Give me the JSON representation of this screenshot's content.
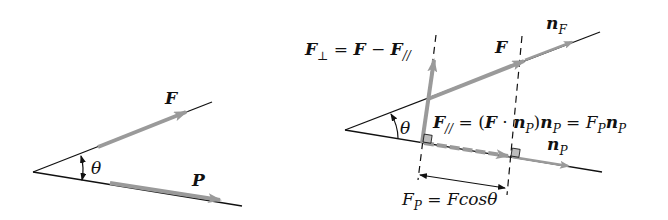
{
  "colors": {
    "line": "#111111",
    "vector": "#9a9a9a",
    "right_angle_fill": "#bdbdbd",
    "background": "#ffffff"
  },
  "left_diagram": {
    "vector_f_label": "F",
    "vector_p_label": "P",
    "angle_label": "θ"
  },
  "right_diagram": {
    "perp_formula": {
      "lhs": "F",
      "lhs_sub": "⊥",
      "eq": " = ",
      "f": "F",
      "minus": " − ",
      "f2": "F",
      "f2_sub": "//"
    },
    "vector_f_label": "F",
    "unit_f_label": "n",
    "unit_f_sub": "F",
    "angle_label": "θ",
    "parallel_formula": {
      "lhs": "F",
      "lhs_sub": "//",
      "eq1": " = (",
      "f": "F",
      "dot": " · ",
      "n1": "n",
      "n1_sub": "P",
      "close": ")",
      "n2": "n",
      "n2_sub": "P",
      "eq2": " = ",
      "fp": "F",
      "fp_sub": "P",
      "n3": "n",
      "n3_sub": "P"
    },
    "unit_p_label": "n",
    "unit_p_sub": "P",
    "projection_formula": {
      "lhs": "F",
      "lhs_sub": "P",
      "eq": " = ",
      "rhs": "Fcos",
      "theta": "θ"
    }
  }
}
